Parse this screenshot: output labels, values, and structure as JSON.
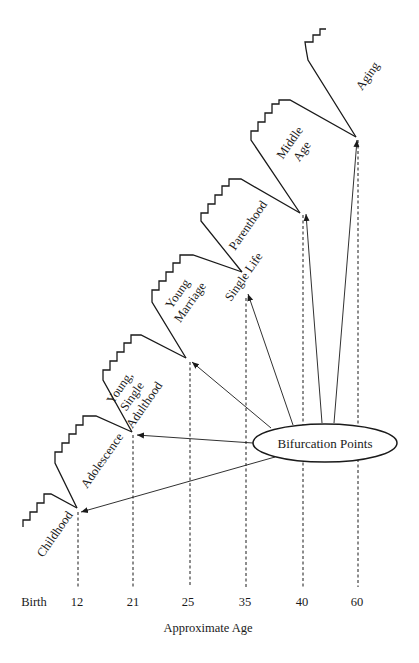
{
  "diagram": {
    "axis_title": "Approximate Age",
    "ticks": [
      {
        "label": "Birth",
        "x": 34
      },
      {
        "label": "12",
        "x": 77
      },
      {
        "label": "21",
        "x": 133
      },
      {
        "label": "25",
        "x": 188
      },
      {
        "label": "35",
        "x": 245
      },
      {
        "label": "40",
        "x": 302
      },
      {
        "label": "60",
        "x": 357
      }
    ],
    "stages": [
      {
        "id": "childhood",
        "lines": [
          "Childhood"
        ]
      },
      {
        "id": "adolescence",
        "lines": [
          "Adolescence"
        ]
      },
      {
        "id": "young-single-adulthood",
        "lines": [
          "Young,",
          "Single",
          "Adulthood"
        ]
      },
      {
        "id": "young-marriage",
        "lines": [
          "Young",
          "Marriage"
        ]
      },
      {
        "id": "single-life",
        "lines": [
          "Single Life"
        ]
      },
      {
        "id": "parenthood",
        "lines": [
          "Parenthood"
        ]
      },
      {
        "id": "middle-age",
        "lines": [
          "Middle",
          "Age"
        ]
      },
      {
        "id": "aging",
        "lines": [
          "Aging"
        ]
      }
    ],
    "center_node": {
      "label": "Bifurcation Points"
    },
    "colors": {
      "ink": "#1a1a1a",
      "background": "#ffffff"
    }
  }
}
